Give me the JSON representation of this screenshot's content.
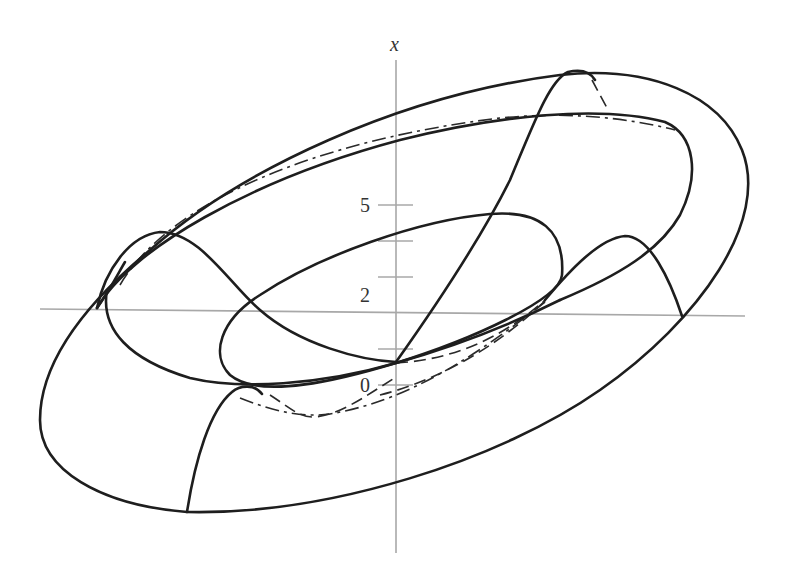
{
  "figure": {
    "axis_label": "x",
    "tick_labels": [
      {
        "text": "5",
        "value": 5
      },
      {
        "text": "2",
        "value": 2
      },
      {
        "text": "0",
        "value": 0
      }
    ],
    "ticks_count": 6,
    "colors": {
      "curve": "#1e1e1e",
      "axis": "#a8a8a8",
      "background": "#ffffff"
    },
    "line_styles": [
      "solid (visible edges)",
      "dashed (hidden edges)",
      "dash-dot (center circle)"
    ]
  }
}
